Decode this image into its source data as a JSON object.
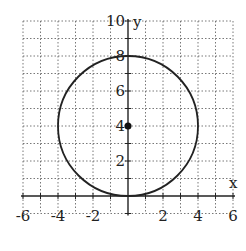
{
  "chart_data": {
    "type": "line",
    "title": "",
    "xlabel": "x",
    "ylabel": "y",
    "xlim": [
      -6,
      6
    ],
    "ylim": [
      -1,
      10
    ],
    "grid": true,
    "grid_style": "dotted",
    "x_ticks": [
      -6,
      -4,
      -2,
      2,
      4,
      6
    ],
    "y_ticks": [
      2,
      4,
      6,
      8,
      10
    ],
    "x_tick_labels": [
      "-6",
      "-4",
      "-2",
      "2",
      "4",
      "6"
    ],
    "y_tick_labels": [
      "2",
      "4",
      "6",
      "8",
      "10"
    ],
    "series": [
      {
        "name": "circle",
        "shape": "circle",
        "center": [
          0,
          4
        ],
        "radius": 4,
        "color": "#222222"
      },
      {
        "name": "center",
        "shape": "point",
        "x": [
          0
        ],
        "y": [
          4
        ],
        "color": "#111111"
      }
    ]
  },
  "labels": {
    "x_axis": "x",
    "y_axis": "y"
  }
}
